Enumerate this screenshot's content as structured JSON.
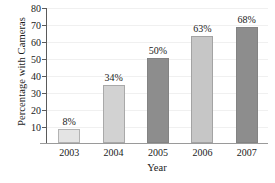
{
  "chart_data": {
    "type": "bar",
    "title": "",
    "xlabel": "Year",
    "ylabel": "Percentage with Cameras",
    "categories": [
      "2003",
      "2004",
      "2005",
      "2006",
      "2007"
    ],
    "values": [
      8,
      34,
      50,
      63,
      68
    ],
    "data_labels": [
      "8%",
      "34%",
      "50%",
      "63%",
      "68%"
    ],
    "bar_colors": [
      "#e4e4e4",
      "#d2d2d2",
      "#8d8d8d",
      "#c6c6c6",
      "#8d8d8d"
    ],
    "ylim": [
      0,
      80
    ],
    "yticks": [
      10,
      20,
      30,
      40,
      50,
      60,
      70,
      80
    ],
    "ytick_labels": [
      "10",
      "20",
      "30",
      "40",
      "50",
      "60",
      "70",
      "80"
    ],
    "grid": true,
    "legend": "none",
    "axis_color": "#5a5a5a",
    "grid_color": "#f0f0f0"
  }
}
